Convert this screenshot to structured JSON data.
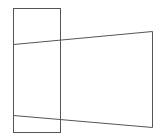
{
  "diagram": {
    "stroke_color": "#555555",
    "background": "#ffffff",
    "rectangle": {
      "x": 13,
      "y": 8,
      "width": 47,
      "height": 124
    },
    "trapezoid": {
      "points": [
        [
          13,
          44
        ],
        [
          152,
          31
        ],
        [
          152,
          127
        ],
        [
          13,
          115
        ]
      ]
    }
  }
}
